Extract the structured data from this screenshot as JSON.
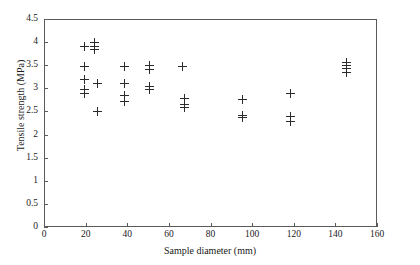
{
  "chart_data": {
    "type": "scatter",
    "title": "",
    "xlabel": "Sample diameter (mm)",
    "ylabel": "Tensile strength (MPa)",
    "xlim": [
      0,
      160
    ],
    "ylim": [
      0,
      4.5
    ],
    "xticks": [
      0,
      20,
      40,
      60,
      80,
      100,
      120,
      140,
      160
    ],
    "xticklabels": [
      "0",
      "20",
      "40",
      "60",
      "80",
      "100",
      "120",
      "140",
      "160"
    ],
    "yticks": [
      0,
      0.5,
      1,
      1.5,
      2,
      2.5,
      3,
      3.5,
      4,
      4.5
    ],
    "yticklabels": [
      "0",
      "0.5",
      "1",
      "1.5",
      "2",
      "2.5",
      "3",
      "3.5",
      "4",
      "4.5"
    ],
    "grid": false,
    "legend": null,
    "marker": "plus",
    "marker_color": "#2b2b2b",
    "series": [
      {
        "name": "Tensile strength vs sample diameter",
        "points": [
          {
            "x": 19,
            "y": 3.93
          },
          {
            "x": 19,
            "y": 3.5
          },
          {
            "x": 19,
            "y": 3.21
          },
          {
            "x": 19,
            "y": 2.99
          },
          {
            "x": 19,
            "y": 2.9
          },
          {
            "x": 24,
            "y": 4.02
          },
          {
            "x": 24,
            "y": 3.93
          },
          {
            "x": 24,
            "y": 3.86
          },
          {
            "x": 25,
            "y": 3.13
          },
          {
            "x": 25,
            "y": 2.52
          },
          {
            "x": 38,
            "y": 3.5
          },
          {
            "x": 38,
            "y": 3.12
          },
          {
            "x": 38,
            "y": 2.87
          },
          {
            "x": 38,
            "y": 2.73
          },
          {
            "x": 50,
            "y": 3.52
          },
          {
            "x": 50,
            "y": 3.43
          },
          {
            "x": 50,
            "y": 3.06
          },
          {
            "x": 50,
            "y": 2.99
          },
          {
            "x": 66,
            "y": 3.5
          },
          {
            "x": 67,
            "y": 2.8
          },
          {
            "x": 67,
            "y": 2.67
          },
          {
            "x": 67,
            "y": 2.6
          },
          {
            "x": 95,
            "y": 2.78
          },
          {
            "x": 95,
            "y": 2.44
          },
          {
            "x": 95,
            "y": 2.38
          },
          {
            "x": 118,
            "y": 2.92
          },
          {
            "x": 118,
            "y": 2.41
          },
          {
            "x": 118,
            "y": 2.3
          },
          {
            "x": 145,
            "y": 3.57
          },
          {
            "x": 145,
            "y": 3.52
          },
          {
            "x": 145,
            "y": 3.46
          },
          {
            "x": 145,
            "y": 3.37
          }
        ]
      }
    ]
  }
}
